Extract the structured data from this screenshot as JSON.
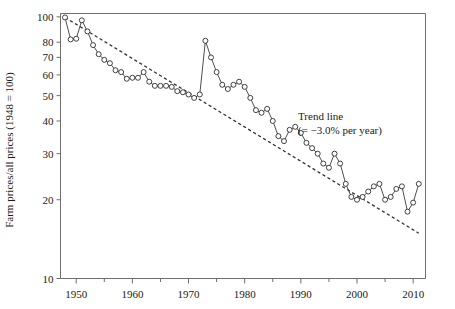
{
  "chart_data": {
    "type": "line",
    "title": "",
    "xlabel": "",
    "ylabel": "Farm prices/all prices (1948 = 100)",
    "yscale": "log",
    "ylim": [
      10,
      103
    ],
    "xlim": [
      1947.2,
      2012.2
    ],
    "grid": false,
    "legend_position": "none",
    "yticks": [
      10,
      20,
      30,
      40,
      50,
      60,
      70,
      80,
      100
    ],
    "ytick_labels": [
      "10",
      "20",
      "30",
      "40",
      "50",
      "60",
      "70",
      "80",
      "100"
    ],
    "xticks": [
      1950,
      1960,
      1970,
      1980,
      1990,
      2000,
      2010
    ],
    "xtick_labels": [
      "1950",
      "1960",
      "1970",
      "1980",
      "1990",
      "2000",
      "2010"
    ],
    "xminor_ticks": [
      1955,
      1965,
      1975,
      1985,
      1995,
      2005
    ],
    "marker": "open-circle",
    "series": [
      {
        "name": "Farm prices / all prices",
        "x": [
          1948,
          1949,
          1950,
          1951,
          1952,
          1953,
          1954,
          1955,
          1956,
          1957,
          1958,
          1959,
          1960,
          1961,
          1962,
          1963,
          1964,
          1965,
          1966,
          1967,
          1968,
          1969,
          1970,
          1971,
          1972,
          1973,
          1974,
          1975,
          1976,
          1977,
          1978,
          1979,
          1980,
          1981,
          1982,
          1983,
          1984,
          1985,
          1986,
          1987,
          1988,
          1989,
          1990,
          1991,
          1992,
          1993,
          1994,
          1995,
          1996,
          1997,
          1998,
          1999,
          2000,
          2001,
          2002,
          2003,
          2004,
          2005,
          2006,
          2007,
          2008,
          2009,
          2010,
          2011
        ],
        "values": [
          99.5,
          82.0,
          82.5,
          97.0,
          88.0,
          78.0,
          72.0,
          68.5,
          66.5,
          62.5,
          61.5,
          58.0,
          58.5,
          58.5,
          61.5,
          56.5,
          54.5,
          54.5,
          54.5,
          54.0,
          52.0,
          51.5,
          50.5,
          49.0,
          50.5,
          81.0,
          70.0,
          61.5,
          55.0,
          53.0,
          55.0,
          56.5,
          54.0,
          49.0,
          44.0,
          43.0,
          44.5,
          40.0,
          35.0,
          33.5,
          37.0,
          38.0,
          36.0,
          33.0,
          31.5,
          30.0,
          27.5,
          26.5,
          30.0,
          27.5,
          23.0,
          20.5,
          20.0,
          20.5,
          21.5,
          22.5,
          23.0,
          20.0,
          20.5,
          22.0,
          22.5,
          18.0,
          19.5,
          23.0
        ]
      }
    ],
    "trendline": {
      "label_line1": "Trend line",
      "label_line2": "(= −3.0% per year)",
      "style": "dashed",
      "rate_percent_per_year": -3.0,
      "x_start": 1948,
      "x_end": 2011,
      "y_start": 99.5,
      "y_end": 14.9
    }
  }
}
